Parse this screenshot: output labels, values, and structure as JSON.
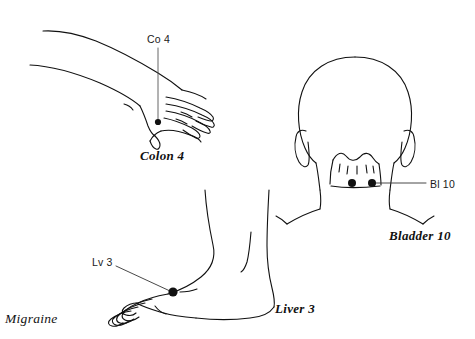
{
  "document": {
    "title": "Migraine",
    "background_color": "#ffffff",
    "ink_color": "#111111",
    "type": "acupuncture point chart"
  },
  "figures": [
    {
      "id": "hand",
      "name": "hand-and-forearm",
      "point_label": "Co 4",
      "caption": "Colon 4",
      "point_count": 1,
      "leader_line": "vertical"
    },
    {
      "id": "head",
      "name": "back-of-head-and-neck",
      "point_label": "Bl 10",
      "caption": "Bladder 10",
      "point_count": 2,
      "leader_line": "horizontal"
    },
    {
      "id": "foot",
      "name": "foot-lateral-view",
      "point_label": "Lv 3",
      "caption": "Liver 3",
      "point_count": 1,
      "leader_line": "diagonal"
    }
  ],
  "labels": {
    "co4": "Co 4",
    "bl10": "Bl 10",
    "lv3": "Lv 3"
  },
  "captions": {
    "colon4": "Colon 4",
    "bladder10": "Bladder 10",
    "liver3": "Liver 3"
  },
  "condition": {
    "name": "Migraine"
  }
}
